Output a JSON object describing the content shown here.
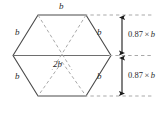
{
  "figure": {
    "shape": "hexagon",
    "colors": {
      "outline": "#4a4a4a",
      "dashed": "#9a9a9a",
      "reference": "#9a9a9a",
      "arrow": "#1a1a1a",
      "text": "#2b2b2b",
      "background": "#ffffff"
    },
    "side_labels": {
      "top": "b",
      "upper_left": "b",
      "upper_right": "b",
      "lower_left": "b",
      "lower_right": "b",
      "bottom": ""
    },
    "diagonal_label": "2b",
    "dimensions": [
      {
        "label_prefix": "0.87",
        "label_times": "×",
        "label_var": "b",
        "label_full": "0.87 × b",
        "span": "upper-half-height"
      },
      {
        "label_prefix": "0.87",
        "label_times": "×",
        "label_var": "b",
        "label_full": "0.87 × b",
        "span": "lower-half-height"
      }
    ]
  }
}
